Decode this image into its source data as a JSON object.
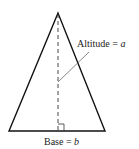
{
  "diagram": {
    "shape": "isosceles-triangle",
    "labels": {
      "altitude": {
        "text": "Altitude = ",
        "var": "a"
      },
      "base": {
        "text": "Base = ",
        "var": "b"
      }
    },
    "colors": {
      "stroke": "#111111",
      "dashed": "#333333",
      "leader": "#555555",
      "text": "#222222"
    },
    "annotations": [
      "right-angle-marker",
      "dashed-altitude",
      "leader-line"
    ]
  }
}
